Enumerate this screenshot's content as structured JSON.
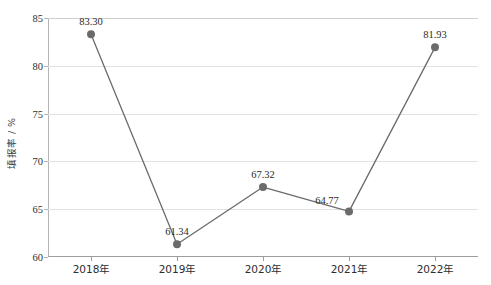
{
  "chart_data": {
    "type": "line",
    "title": "",
    "xlabel": "",
    "ylabel": "填报率 / %",
    "categories": [
      "2018年",
      "2019年",
      "2020年",
      "2021年",
      "2022年"
    ],
    "values": [
      83.3,
      61.34,
      67.32,
      64.77,
      81.93
    ],
    "point_labels": [
      "83.30",
      "61.34",
      "67.32",
      "64.77",
      "81.93"
    ],
    "series": [
      {
        "name": "填报率",
        "values": [
          83.3,
          61.34,
          67.32,
          64.77,
          81.93
        ]
      }
    ],
    "ylim": [
      60,
      85
    ],
    "yticks": [
      60,
      65,
      70,
      75,
      80,
      85
    ],
    "ytick_labels": [
      "60",
      "65",
      "70",
      "75",
      "80",
      "85"
    ],
    "grid": true,
    "grid_axis": "y",
    "legend": false,
    "legend_position": "none",
    "marker": "circle",
    "line_color": "#6b6b6b",
    "marker_color": "#6b6b6b",
    "grid_color": "#e2e2e2",
    "axis_color": "#9d9d9d",
    "text_color": "#2e2e2e"
  }
}
